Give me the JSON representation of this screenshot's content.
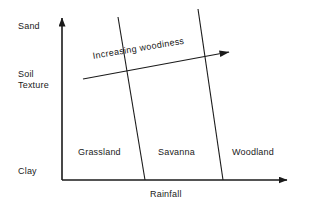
{
  "figure": {
    "background_color": "#ffffff",
    "ink_color": "#1a1a1a",
    "axes": {
      "y_axis": {
        "name": "Soil Texture",
        "top_label": "Sand",
        "mid_label_line1": "Soil",
        "mid_label_line2": "Texture",
        "bottom_label": "Clay"
      },
      "x_axis": {
        "name": "Rainfall",
        "label": "Rainfall"
      }
    },
    "zones": [
      {
        "label": "Grassland"
      },
      {
        "label": "Savanna"
      },
      {
        "label": "Woodland"
      }
    ],
    "annotation": {
      "label": "Increasing woodiness",
      "direction": "up-right"
    }
  }
}
